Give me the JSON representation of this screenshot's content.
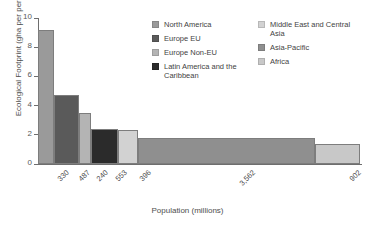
{
  "chart_data": {
    "type": "bar",
    "title": "",
    "xlabel": "Population (millions)",
    "ylabel": "Ecological Footprint (gha per person)",
    "ylim": [
      0,
      10
    ],
    "yticks": [
      0,
      2,
      4,
      6,
      8,
      10
    ],
    "ytick_labels": [
      "0",
      "2",
      "4",
      "6",
      "8",
      "10"
    ],
    "grid": false,
    "legend_position": "top-right",
    "note": "Variable-width bar chart (Marimekko style): bar width is proportional to population, bar height is ecological footprint per person.",
    "categories": [
      "North America",
      "Europe EU",
      "Europe Non-EU",
      "Latin America and the Caribbean",
      "Middle East and Central Asia",
      "Asia-Pacific",
      "Africa"
    ],
    "values": [
      9.2,
      4.7,
      3.5,
      2.4,
      2.3,
      1.75,
      1.4
    ],
    "widths": [
      330,
      487,
      240,
      553,
      396,
      3562,
      902
    ],
    "xtick_labels": [
      "330",
      "487",
      "240",
      "553",
      "396",
      "3,562",
      "902"
    ],
    "colors": [
      "#9a9a9a",
      "#5a5a5a",
      "#b4b4b4",
      "#2b2b2b",
      "#d2d2d2",
      "#8f8f8f",
      "#c8c8c8"
    ],
    "bars": [
      {
        "name": "North America",
        "value": 9.2,
        "width": 330,
        "xtick": "330",
        "color": "#9a9a9a"
      },
      {
        "name": "Europe EU",
        "value": 4.7,
        "width": 487,
        "xtick": "487",
        "color": "#5a5a5a"
      },
      {
        "name": "Europe Non-EU",
        "value": 3.5,
        "width": 240,
        "xtick": "240",
        "color": "#b4b4b4"
      },
      {
        "name": "Latin America and the Caribbean",
        "value": 2.4,
        "width": 553,
        "xtick": "553",
        "color": "#2b2b2b"
      },
      {
        "name": "Middle East and Central Asia",
        "value": 2.3,
        "width": 396,
        "xtick": "396",
        "color": "#d2d2d2"
      },
      {
        "name": "Asia-Pacific",
        "value": 1.75,
        "width": 3562,
        "xtick": "3,562",
        "color": "#8f8f8f"
      },
      {
        "name": "Africa",
        "value": 1.4,
        "width": 902,
        "xtick": "902",
        "color": "#c8c8c8"
      }
    ]
  },
  "legend": {
    "column_left": [
      {
        "label": "North America",
        "color": "#9a9a9a"
      },
      {
        "label": "Europe EU",
        "color": "#5a5a5a"
      },
      {
        "label": "Europe Non-EU",
        "color": "#b4b4b4"
      },
      {
        "label": "Latin America and the Caribbean",
        "color": "#2b2b2b"
      }
    ],
    "column_right": [
      {
        "label": "Middle East and Central Asia",
        "color": "#d2d2d2"
      },
      {
        "label": "Asia-Pacific",
        "color": "#8f8f8f"
      },
      {
        "label": "Africa",
        "color": "#c8c8c8"
      }
    ]
  }
}
